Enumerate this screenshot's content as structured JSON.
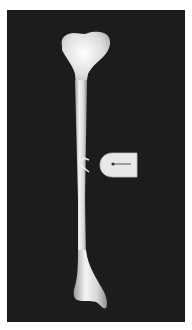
{
  "figure": {
    "background_color": "#1c1c1c",
    "bone_color": "#e6e6e6",
    "marker": {
      "type": "callout-arrow",
      "direction": "left",
      "label": ""
    }
  }
}
